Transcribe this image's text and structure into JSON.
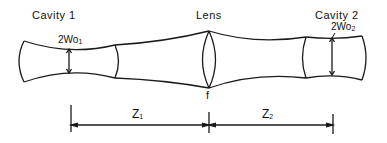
{
  "labels": {
    "cavity1": "Cavity 1",
    "lens": "Lens",
    "cavity2": "Cavity 2",
    "waist1_main": "2Wo",
    "waist1_sub": "1",
    "waist2_main": "2Wo",
    "waist2_sub": "2",
    "focal": "f",
    "z1_main": "Z",
    "z1_sub": "1",
    "z2_main": "Z",
    "z2_sub": "2"
  },
  "colors": {
    "stroke": "#1a1a1a",
    "background": "#ffffff"
  }
}
